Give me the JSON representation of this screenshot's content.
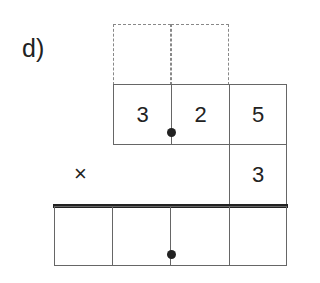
{
  "exercise": {
    "label": "d)",
    "operator": "×",
    "multiplicand_digits": [
      "3",
      "2",
      "5"
    ],
    "multiplier_digits": [
      "3"
    ],
    "carry_boxes": [
      "",
      ""
    ],
    "result_boxes": [
      "",
      "",
      "",
      ""
    ],
    "decimal_marker": "dot"
  }
}
